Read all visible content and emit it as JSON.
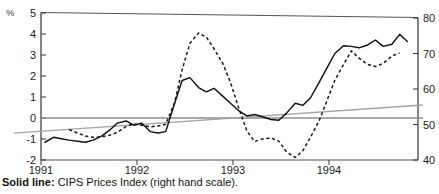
{
  "chart_data": {
    "type": "line",
    "title": "",
    "xlabel": "",
    "ylabel": "%",
    "grid": false,
    "legend_position": "below-plot",
    "x_axis": {
      "tick_labels": [
        "1991",
        "1992",
        "1993",
        "1994"
      ],
      "tick_values": [
        1991.0,
        1992.0,
        1993.0,
        1994.0
      ],
      "range": [
        1991.0,
        1994.9
      ]
    },
    "y_axis_left": {
      "label": "%",
      "tick_labels": [
        "5",
        "4",
        "3",
        "2",
        "1",
        "0",
        "-1",
        "-2"
      ],
      "tick_values": [
        5,
        4,
        3,
        2,
        1,
        0,
        -1,
        -2
      ],
      "range": [
        -2,
        5
      ]
    },
    "y_axis_right": {
      "label": "",
      "tick_labels": [
        "80",
        "70",
        "60",
        "50",
        "40"
      ],
      "tick_values": [
        80,
        70,
        60,
        50,
        40
      ],
      "range": [
        40,
        80
      ]
    },
    "series": [
      {
        "name": "CIPS Prices Index (right hand scale)",
        "style": "solid",
        "axis": "right",
        "x": [
          1991.04,
          1991.13,
          1991.21,
          1991.29,
          1991.38,
          1991.46,
          1991.54,
          1991.63,
          1991.71,
          1991.79,
          1991.88,
          1991.96,
          1992.04,
          1992.13,
          1992.21,
          1992.29,
          1992.38,
          1992.46,
          1992.54,
          1992.63,
          1992.71,
          1992.79,
          1992.88,
          1992.96,
          1993.04,
          1993.13,
          1993.21,
          1993.29,
          1993.38,
          1993.46,
          1993.54,
          1993.63,
          1993.71,
          1993.79,
          1993.88,
          1993.96,
          1994.04,
          1994.13,
          1994.21,
          1994.29,
          1994.38,
          1994.46,
          1994.54,
          1994.63,
          1994.71,
          1994.79
        ],
        "values": [
          45.0,
          46.4,
          46.0,
          45.6,
          45.3,
          45.0,
          45.6,
          46.8,
          48.4,
          50.4,
          51.0,
          49.8,
          50.4,
          48.0,
          47.6,
          48.0,
          55.8,
          62.4,
          63.2,
          60.4,
          59.2,
          60.2,
          58.0,
          56.0,
          54.0,
          52.4,
          52.8,
          52.2,
          51.4,
          51.2,
          53.2,
          56.0,
          55.4,
          57.6,
          62.0,
          66.0,
          70.0,
          72.2,
          72.0,
          71.6,
          72.4,
          73.8,
          72.0,
          72.6,
          75.4,
          73.4
        ]
      },
      {
        "name": "dashed-series",
        "style": "dashed",
        "axis": "left",
        "x": [
          1991.29,
          1991.38,
          1991.46,
          1991.54,
          1991.63,
          1991.71,
          1991.79,
          1991.88,
          1991.96,
          1992.04,
          1992.13,
          1992.21,
          1992.29,
          1992.38,
          1992.46,
          1992.54,
          1992.63,
          1992.71,
          1992.79,
          1992.88,
          1992.96,
          1993.04,
          1993.13,
          1993.21,
          1993.29,
          1993.38,
          1993.46,
          1993.54,
          1993.63,
          1993.71,
          1993.79,
          1993.88,
          1993.96,
          1994.04,
          1994.13,
          1994.21,
          1994.29,
          1994.38,
          1994.46,
          1994.54,
          1994.63,
          1994.71
        ],
        "values": [
          -0.55,
          -0.72,
          -0.86,
          -0.92,
          -0.9,
          -0.82,
          -0.68,
          -0.4,
          -0.28,
          -0.35,
          -0.42,
          -0.38,
          -0.3,
          0.7,
          2.3,
          3.55,
          4.05,
          3.85,
          3.3,
          2.6,
          1.7,
          0.55,
          -0.62,
          -1.12,
          -1.0,
          -0.95,
          -1.1,
          -1.62,
          -1.88,
          -1.55,
          -0.9,
          -0.1,
          0.85,
          1.8,
          2.55,
          3.2,
          2.85,
          2.55,
          2.45,
          2.6,
          2.95,
          3.1
        ]
      },
      {
        "name": "trend-line",
        "style": "solid-grey",
        "axis": "left",
        "x": [
          1990.72,
          1994.95
        ],
        "values": [
          -0.72,
          0.62
        ]
      },
      {
        "name": "zero-line",
        "style": "solid-grey-horizontal",
        "axis": "left",
        "x": [
          1991.0,
          1994.95
        ],
        "values": [
          0.0,
          0.0
        ]
      }
    ],
    "annotations": []
  },
  "caption": {
    "key": "Solid line:",
    "text": "CIPS Prices Index (right hand scale)."
  }
}
